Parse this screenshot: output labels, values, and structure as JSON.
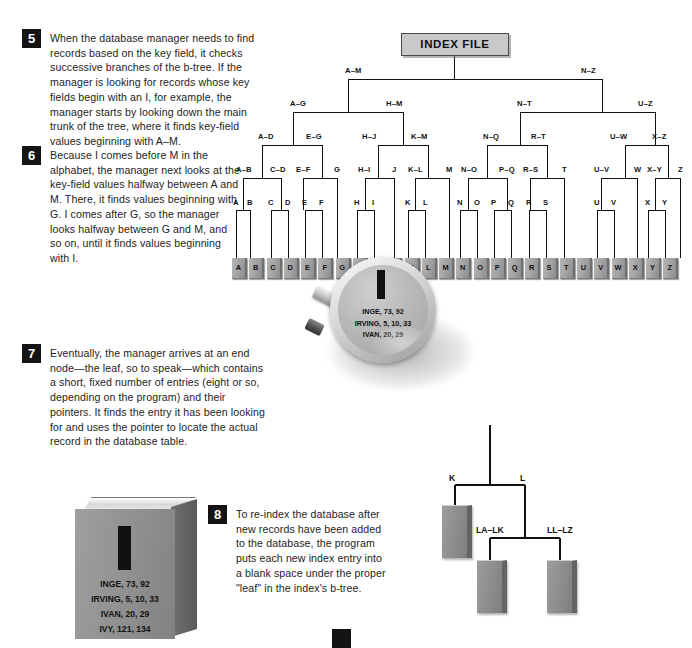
{
  "doc": {
    "title": "How a database b-tree index works",
    "steps": [
      {
        "number": "5",
        "text": "When the database manager needs to find records based on the key field, it checks successive branches of the b-tree. If the manager is looking for records whose key fields begin with an I, for example, the manager starts by looking down the main trunk of the tree, where it finds key-field values beginning with A–M."
      },
      {
        "number": "6",
        "text": "Because I comes before M in the alphabet, the manager next looks at the key-field values halfway between A and M. There, it finds values beginning with G. I comes after G, so the manager looks halfway between G and M, and so on, until it finds values beginning with I."
      },
      {
        "number": "7",
        "text": "Eventually, the manager arrives at an end node—the leaf, so to speak—which contains a short, fixed number of entries (eight or so, depending on the program) and their pointers. It finds the entry it has been looking for and uses the pointer to locate the actual record in the database table."
      },
      {
        "number": "8",
        "text": "To re-index the database after new records have been added to the database, the program puts each new index entry into a blank space under the proper \"leaf\" in the index's b-tree."
      }
    ]
  },
  "tree": {
    "root_label": "INDEX FILE",
    "level1": [
      "A–M",
      "N–Z"
    ],
    "level2": [
      "A–G",
      "H–M",
      "N–T",
      "U–Z"
    ],
    "level3": [
      "A–D",
      "E–G",
      "H–J",
      "K–M",
      "N–Q",
      "R–T",
      "U–W",
      "X–Z"
    ],
    "level4": [
      "A–B",
      "C–D",
      "E–F",
      "G",
      "H–I",
      "J",
      "K–L",
      "M",
      "N–O",
      "P–Q",
      "R–S",
      "T",
      "U–V",
      "W",
      "X–Y",
      "Z"
    ],
    "level5": [
      "A",
      "B",
      "C",
      "D",
      "E",
      "F",
      "H",
      "I",
      "K",
      "L",
      "N",
      "O",
      "P",
      "Q",
      "R",
      "S",
      "U",
      "V",
      "X",
      "Y"
    ],
    "cards": [
      "A",
      "B",
      "C",
      "D",
      "E",
      "F",
      "G",
      "H",
      "I",
      "J",
      "K",
      "L",
      "M",
      "N",
      "O",
      "P",
      "Q",
      "R",
      "S",
      "T",
      "U",
      "V",
      "W",
      "X",
      "Y",
      "Z"
    ]
  },
  "magnifier": {
    "letter": "I",
    "entries": [
      "INGE, 73, 92",
      "IRVING, 5, 10, 33",
      "IVAN, 20, 29"
    ]
  },
  "book": {
    "letter": "I",
    "entries": [
      "INGE, 73, 92",
      "IRVING, 5, 10, 33",
      "IVAN, 20, 29",
      "IVY, 121, 134"
    ]
  },
  "leaf_diagram": {
    "labels": [
      "K",
      "L",
      "LA–LK",
      "LL–LZ"
    ]
  },
  "colors": {
    "ink": "#1a1a1a",
    "badge_bg": "#141414",
    "badge_fg": "#ffffff",
    "index_box_bg": "#c9c9c9",
    "card_gray": "#9a9a9a",
    "line": "#111111"
  }
}
